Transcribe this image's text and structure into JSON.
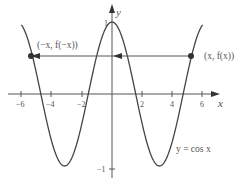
{
  "chart_data": {
    "type": "line",
    "title": "",
    "xlabel": "x",
    "ylabel": "y",
    "xlim": [
      -6.5,
      6.2
    ],
    "ylim": [
      -1.15,
      1.15
    ],
    "xticks": [
      -6,
      -4,
      -2,
      2,
      4,
      6
    ],
    "xtick_labels": [
      "−6",
      "−4",
      "−2",
      "2",
      "4",
      "6"
    ],
    "yticks": [
      1,
      -1
    ],
    "ytick_labels": [
      "1",
      "−1"
    ],
    "grid": false,
    "series": [
      {
        "name": "y = cos x",
        "function": "cos(x)",
        "x_range": [
          -6.0,
          6.0
        ]
      }
    ],
    "annotations": [
      {
        "text": "(x, f(x))",
        "x": 5.3,
        "y": 0.55,
        "marker": "dot"
      },
      {
        "text": "(−x, f(−x))",
        "x": -5.3,
        "y": 0.55,
        "marker": "dot"
      },
      {
        "text": "y = cos x",
        "x": 4.5,
        "y": -0.7
      }
    ],
    "arrow": {
      "from_x": 5.3,
      "to_x": -5.3,
      "y": 0.55,
      "direction": "left"
    }
  },
  "labels": {
    "x_axis": "x",
    "y_axis": "y",
    "right_point": "(x, f(x))",
    "left_point": "(−x, f(−x))",
    "curve_label": "y = cos x",
    "y_one": "1",
    "y_neg_one": "−1",
    "tick_m6": "−6",
    "tick_m4": "−4",
    "tick_m2": "−2",
    "tick_2": "2",
    "tick_4": "4",
    "tick_6": "6"
  },
  "colors": {
    "curve": "#444444",
    "axis": "#555555",
    "point": "#333333",
    "text": "#555555"
  }
}
